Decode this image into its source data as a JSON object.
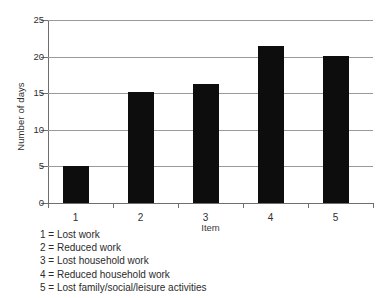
{
  "chart_data": {
    "type": "bar",
    "title": "",
    "subtitle": "",
    "xlabel": "Item",
    "ylabel": "Number of days",
    "categories": [
      "1",
      "2",
      "3",
      "4",
      "5"
    ],
    "values": [
      5.0,
      15.1,
      16.2,
      21.4,
      20.1
    ],
    "ylim": [
      0,
      25
    ],
    "yticks": [
      0,
      5,
      10,
      15,
      20,
      25
    ],
    "ytick_labels": [
      "0",
      "5",
      "10",
      "15",
      "20",
      "25"
    ],
    "grid": "horizontal",
    "legend_position": "below-axis-left",
    "bar_color": "#0d0d0d",
    "gridline_color": "#9a9a9a",
    "axis_color": "#6e6e6e",
    "background_color": "#ffffff",
    "annotations": [
      "1 = Lost work",
      "2 = Reduced work",
      "3 = Lost household work",
      "4 = Reduced household work",
      "5 = Lost family/social/leisure activities"
    ]
  },
  "key": {
    "lines": [
      "1 = Lost work",
      "2 = Reduced work",
      "3 = Lost household work",
      "4 = Reduced household work",
      "5 = Lost family/social/leisure activities"
    ]
  }
}
